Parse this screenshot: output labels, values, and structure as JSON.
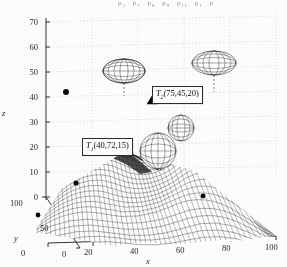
{
  "figure": {
    "kind": "3d-surface-mesh-plot",
    "background_color": "#fdfdfc",
    "line_color": "#1c1c1c",
    "cropped_header_note": "p5  p7  p8  p9  p11      p1   p"
  },
  "header_fragments": [
    {
      "base": "p",
      "sub": "5"
    },
    {
      "base": "p",
      "sub": "7"
    },
    {
      "base": "p",
      "sub": "8"
    },
    {
      "base": "p",
      "sub": "9"
    },
    {
      "base": "p",
      "sub": "11"
    },
    {
      "base": "p",
      "sub": "1"
    },
    {
      "base": "p",
      "sub": ""
    }
  ],
  "axes": {
    "z": {
      "label": "z",
      "ticks": [
        "0",
        "10",
        "20",
        "30",
        "40",
        "50",
        "60",
        "70"
      ],
      "min": 0,
      "max": 70,
      "step": 10
    },
    "x": {
      "label": "x",
      "ticks": [
        "0",
        "20",
        "40",
        "60",
        "80",
        "100"
      ],
      "min": 0,
      "max": 100,
      "step": 20
    },
    "y": {
      "label": "y",
      "ticks": [
        "0",
        "50",
        "100"
      ],
      "min": 0,
      "max": 100,
      "step": 50
    }
  },
  "annotations": [
    {
      "id": "target-1",
      "base": "T",
      "sub": "1",
      "coords": "(40,72,15)",
      "full": "T1(40,72,15)"
    },
    {
      "id": "target-2",
      "base": "T",
      "sub": "2",
      "coords": "(75,45,20)",
      "full": "T2(75,45,20)"
    }
  ],
  "chart_data": {
    "type": "line",
    "title": "",
    "xlabel": "x",
    "ylabel": "y",
    "zlabel": "z",
    "xlim": [
      0,
      100
    ],
    "ylim": [
      0,
      100
    ],
    "zlim": [
      0,
      70
    ],
    "grid": true,
    "legend": "none",
    "projection": "3d",
    "surface": {
      "description": "wireframe mesh terrain with multiple peaks and valleys",
      "mesh_u": 60,
      "mesh_v": 60,
      "peaks": [
        {
          "x": 40,
          "y": 72,
          "z": 15
        },
        {
          "x": 75,
          "y": 45,
          "z": 20
        },
        {
          "x": 18,
          "y": 30,
          "z": 12
        },
        {
          "x": 58,
          "y": 20,
          "z": 17
        }
      ]
    },
    "ellipsoids": [
      {
        "id": "ellipsoid-left-upper",
        "cx": 124,
        "cy": 71,
        "rx": 21,
        "ry": 12
      },
      {
        "id": "ellipsoid-right-upper",
        "cx": 214,
        "cy": 63,
        "rx": 22,
        "ry": 12
      },
      {
        "id": "ellipsoid-mid-surface",
        "cx": 158,
        "cy": 151,
        "rx": 18,
        "ry": 18
      },
      {
        "id": "ellipsoid-left-surface",
        "cx": 179,
        "cy": 129,
        "rx": 14,
        "ry": 14
      }
    ],
    "markers": [
      {
        "type": "dot",
        "x": 66,
        "y": 92
      },
      {
        "type": "dot",
        "x": 106,
        "y": 143
      },
      {
        "type": "dot",
        "x": 76,
        "y": 183
      },
      {
        "type": "dot",
        "x": 38,
        "y": 215
      },
      {
        "type": "dot",
        "x": 203,
        "y": 196
      },
      {
        "type": "triangle",
        "x": 152,
        "y": 101
      },
      {
        "type": "triangle",
        "x": 119,
        "y": 147
      }
    ]
  }
}
